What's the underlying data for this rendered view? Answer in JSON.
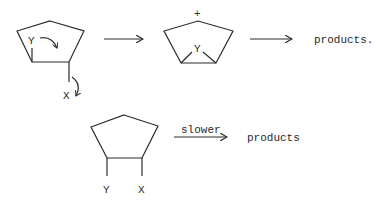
{
  "diagram": {
    "type": "reaction-scheme",
    "reaction_1": {
      "reactant": {
        "ring": "cyclopentane",
        "substituents": [
          "Y",
          "X"
        ],
        "arrows": [
          "Y curved arrow into ring",
          "X leaving curved arrow"
        ]
      },
      "intermediate": {
        "ring": "bridged cyclopentyl cation",
        "bridging_atom": "Y",
        "charge": "+"
      },
      "product_label": "products."
    },
    "reaction_2": {
      "reactant": {
        "ring": "cyclopentane",
        "substituents": [
          "Y",
          "X"
        ]
      },
      "arrow_label": "slower",
      "product_label": "products"
    }
  }
}
